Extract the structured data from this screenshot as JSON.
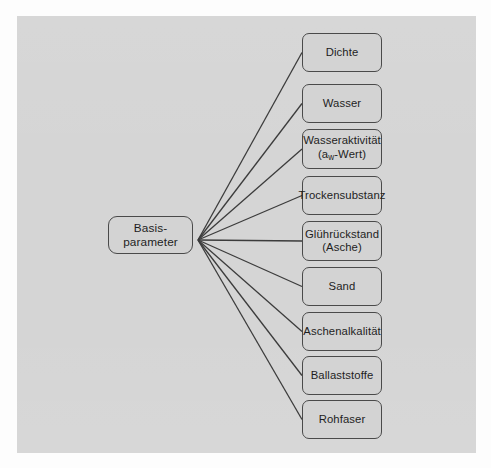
{
  "diagram": {
    "background_color": "#d5d5d5",
    "page_color": "#fdfdfd",
    "node_fill": "#d3d3d3",
    "node_border": "#4a4a4a",
    "edge_color": "#3c3c3c",
    "root": {
      "label": "Basis-\nparameter",
      "x": 108,
      "y": 216,
      "width": 85,
      "height": 38
    },
    "hub": {
      "x": 198,
      "y": 240
    },
    "branches": [
      {
        "label": "Dichte",
        "label2": "",
        "sub": "",
        "x": 302,
        "y": 33,
        "width": 80,
        "height": 39
      },
      {
        "label": "Wasser",
        "label2": "",
        "sub": "",
        "x": 302,
        "y": 84,
        "width": 80,
        "height": 39
      },
      {
        "label": "Wasseraktivität",
        "label2": "-Wert)",
        "sub": "w",
        "pre2": "(a",
        "x": 302,
        "y": 129,
        "width": 80,
        "height": 40
      },
      {
        "label": "Trockensubstanz",
        "label2": "",
        "sub": "",
        "x": 302,
        "y": 176,
        "width": 80,
        "height": 39
      },
      {
        "label": "Glührückstand",
        "label2": "(Asche)",
        "sub": "",
        "x": 302,
        "y": 221,
        "width": 80,
        "height": 40
      },
      {
        "label": "Sand",
        "label2": "",
        "sub": "",
        "x": 302,
        "y": 267,
        "width": 80,
        "height": 39
      },
      {
        "label": "Aschenalkalität",
        "label2": "",
        "sub": "",
        "x": 302,
        "y": 312,
        "width": 80,
        "height": 39
      },
      {
        "label": "Ballaststoffe",
        "label2": "",
        "sub": "",
        "x": 302,
        "y": 356,
        "width": 80,
        "height": 39
      },
      {
        "label": "Rohfaser",
        "label2": "",
        "sub": "",
        "x": 302,
        "y": 400,
        "width": 80,
        "height": 39
      }
    ]
  }
}
